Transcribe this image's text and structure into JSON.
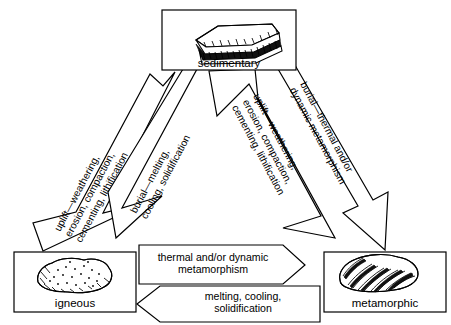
{
  "diagram": {
    "background_color": "#ffffff",
    "line_color": "#000000"
  },
  "nodes": {
    "sedimentary": {
      "label": "sedimentary",
      "icon": "layered-sedimentary-rock-icon"
    },
    "igneous": {
      "label": "igneous",
      "icon": "speckled-igneous-rock-icon"
    },
    "metamorphic": {
      "label": "metamorphic",
      "icon": "banded-metamorphic-rock-icon"
    }
  },
  "arrows": {
    "igneous_to_sedimentary": {
      "line1": "uplift—weathering,",
      "line2": "erosion, compaction,",
      "line3": "cementing, lithification",
      "direction": "igneous-to-sedimentary"
    },
    "sedimentary_to_igneous": {
      "line1": "burial—melting,",
      "line2": "cooling, solidification",
      "direction": "sedimentary-to-igneous"
    },
    "metamorphic_to_sedimentary": {
      "line1": "uplift—weathering,",
      "line2": "erosion, compaction,",
      "line3": "cementing, lithification",
      "direction": "metamorphic-to-sedimentary"
    },
    "sedimentary_to_metamorphic": {
      "line1": "burial—thermal and/or",
      "line2": "dynamic metamorphism",
      "direction": "sedimentary-to-metamorphic"
    },
    "igneous_to_metamorphic": {
      "line1": "thermal and/or dynamic",
      "line2": "metamorphism",
      "direction": "igneous-to-metamorphic"
    },
    "metamorphic_to_igneous": {
      "line1": "melting, cooling,",
      "line2": "solidification",
      "direction": "metamorphic-to-igneous"
    }
  }
}
